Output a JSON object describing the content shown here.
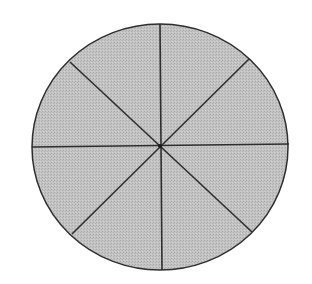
{
  "diagram": {
    "type": "divided-circle",
    "description": "Circle divided into 8 equal sectors by 4 lines through the center",
    "sector_count": 8,
    "center": [
      160,
      146
    ],
    "radius_x": 128,
    "radius_y": 123,
    "colors": {
      "fill": "#bdbdbd",
      "stroke": "#2e2e2e",
      "background": "#ffffff"
    },
    "lines": [
      {
        "name": "vertical",
        "x1": 160,
        "y1": 24,
        "x2": 162,
        "y2": 270
      },
      {
        "name": "horizontal",
        "x1": 32,
        "y1": 147,
        "x2": 289,
        "y2": 144
      },
      {
        "name": "diagonal-down",
        "x1": 70,
        "y1": 62,
        "x2": 252,
        "y2": 232
      },
      {
        "name": "diagonal-up",
        "x1": 72,
        "y1": 234,
        "x2": 249,
        "y2": 59
      }
    ]
  }
}
